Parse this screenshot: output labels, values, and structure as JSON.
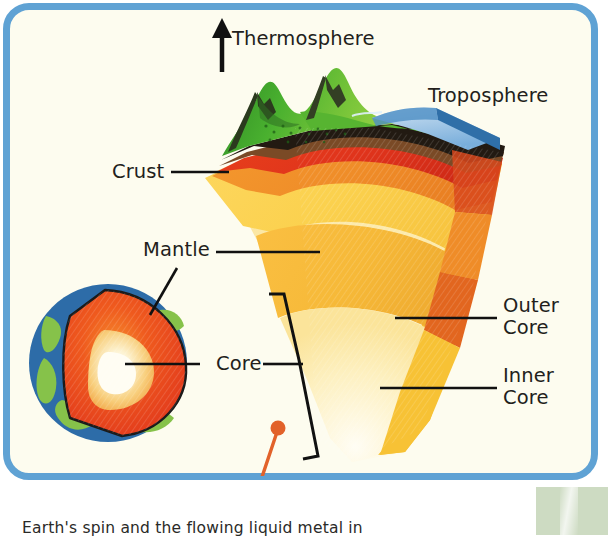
{
  "figure": {
    "panel_border_color": "#5fa2d4",
    "panel_background_color": "#fdfcef",
    "accent_pin_color": "#e2622a"
  },
  "labels": {
    "thermosphere": "Thermosphere",
    "troposphere": "Troposphere",
    "crust": "Crust",
    "mantle": "Mantle",
    "core": "Core",
    "outer_core_line1": "Outer",
    "outer_core_line2": "Core",
    "inner_core_line1": "Inner",
    "inner_core_line2": "Core"
  },
  "caption": {
    "text": "Earth's spin and the flowing liquid metal in"
  },
  "icons": {
    "up_arrow": "up-arrow-icon",
    "pin_marker": "pin-marker-icon",
    "bracket": "bracket-icon"
  },
  "layer_colors": {
    "vegetation": "#3faa2e",
    "mountain_rock": "#2f3b22",
    "ocean_surface": "#a9cbe8",
    "ocean_edge": "#2f6fa8",
    "crust_dark": "#211a12",
    "crust_brown": "#6b4426",
    "mantle_red": "#e0341c",
    "mantle_orange": "#f0922c",
    "mantle_gold": "#f6b938",
    "mantle_yellow": "#fbd14e",
    "outer_core": "#fbd769",
    "inner_core": "#fcf0c4",
    "side_face_orange": "#e2661f",
    "side_face_gold": "#f7c235",
    "globe_ocean": "#2d6ca8",
    "globe_land": "#86c24a",
    "globe_mantle": "#e8421c",
    "globe_core": "#fdf6e0"
  }
}
